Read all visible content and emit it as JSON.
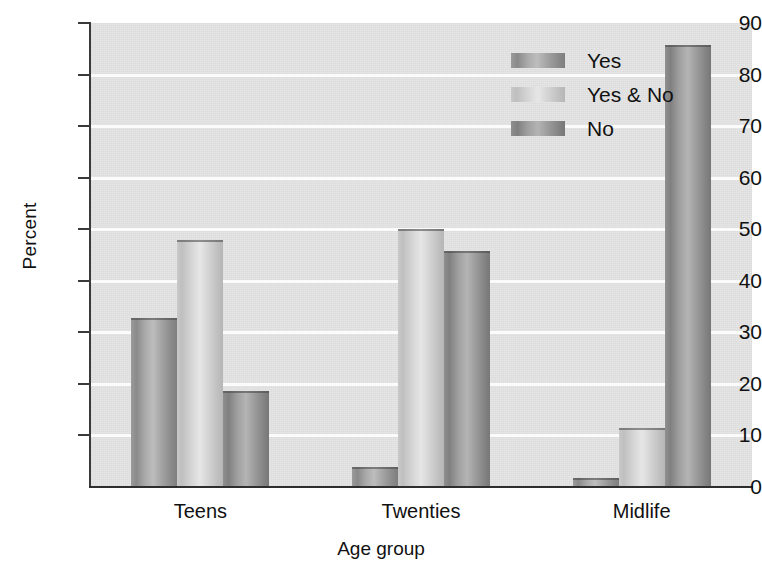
{
  "chart_data": {
    "type": "bar",
    "title": "",
    "xlabel": "Age group",
    "ylabel": "Percent",
    "ylim": [
      0,
      90
    ],
    "ytick_step": 10,
    "yticks": [
      "0",
      "10",
      "20",
      "30",
      "40",
      "50",
      "60",
      "70",
      "80",
      "90"
    ],
    "categories": [
      "Teens",
      "Twenties",
      "Midlife"
    ],
    "grid": "horizontal",
    "legend_position": "upper center-right inside plot",
    "series": [
      {
        "name": "Yes",
        "color": "#9a9a9a",
        "values": [
          32.7,
          3.8,
          1.8
        ]
      },
      {
        "name": "Yes & No",
        "color": "#d3d3d3",
        "values": [
          48.0,
          50.0,
          11.5
        ]
      },
      {
        "name": "No",
        "color": "#8e8e8e",
        "values": [
          18.7,
          45.7,
          85.7
        ]
      }
    ]
  },
  "legend": {
    "items": [
      {
        "label": "Yes"
      },
      {
        "label": "Yes & No"
      },
      {
        "label": "No"
      }
    ]
  },
  "axes": {
    "y_title": "Percent",
    "x_title": "Age group"
  },
  "colors": {
    "plot_background": "#e4e4e4",
    "gridline": "#fbfbfb",
    "axis": "#333333",
    "text": "#111111",
    "page_background": "#ffffff"
  }
}
